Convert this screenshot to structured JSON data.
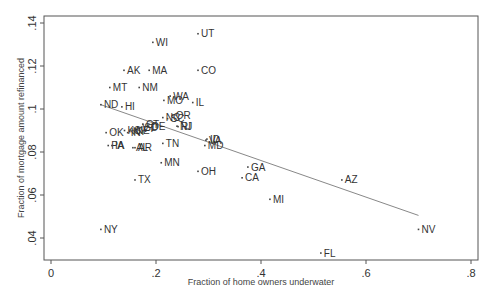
{
  "chart_data": {
    "type": "scatter",
    "title": "",
    "xlabel": "Fraction of home owners underwater",
    "ylabel": "Fraction of mortgage amount refinanced",
    "xlim": [
      -0.015,
      0.813
    ],
    "ylim": [
      0.029,
      0.143
    ],
    "xticks": [
      0,
      0.2,
      0.4,
      0.6,
      0.8
    ],
    "xtick_labels": [
      "0",
      ".2",
      ".4",
      ".6",
      ".8"
    ],
    "yticks": [
      0.04,
      0.06,
      0.08,
      0.1,
      0.12,
      0.14
    ],
    "ytick_labels": [
      ".04",
      ".06",
      ".08",
      ".1",
      ".12",
      ".14"
    ],
    "grid": false,
    "legend": "none",
    "fit_line": {
      "x": [
        0.095,
        0.7
      ],
      "y": [
        0.102,
        0.0505
      ]
    },
    "points": [
      {
        "label": "UT",
        "x": 0.28,
        "y": 0.135
      },
      {
        "label": "WI",
        "x": 0.194,
        "y": 0.131
      },
      {
        "label": "AK",
        "x": 0.139,
        "y": 0.118
      },
      {
        "label": "MA",
        "x": 0.187,
        "y": 0.118
      },
      {
        "label": "CO",
        "x": 0.28,
        "y": 0.118
      },
      {
        "label": "MT",
        "x": 0.112,
        "y": 0.11
      },
      {
        "label": "NM",
        "x": 0.168,
        "y": 0.11
      },
      {
        "label": "WA",
        "x": 0.227,
        "y": 0.106
      },
      {
        "label": "MO",
        "x": 0.215,
        "y": 0.104
      },
      {
        "label": "IL",
        "x": 0.27,
        "y": 0.103
      },
      {
        "label": "ND",
        "x": 0.095,
        "y": 0.102
      },
      {
        "label": "HI",
        "x": 0.135,
        "y": 0.101
      },
      {
        "label": "NC",
        "x": 0.213,
        "y": 0.096
      },
      {
        "label": "SC",
        "x": 0.222,
        "y": 0.0955
      },
      {
        "label": "OR",
        "x": 0.232,
        "y": 0.097
      },
      {
        "label": "NJ",
        "x": 0.24,
        "y": 0.092
      },
      {
        "label": "RI",
        "x": 0.242,
        "y": 0.0918
      },
      {
        "label": "CT",
        "x": 0.175,
        "y": 0.093
      },
      {
        "label": "DE",
        "x": 0.186,
        "y": 0.092
      },
      {
        "label": "VT",
        "x": 0.168,
        "y": 0.091
      },
      {
        "label": "SD",
        "x": 0.172,
        "y": 0.0915
      },
      {
        "label": "KS",
        "x": 0.14,
        "y": 0.09
      },
      {
        "label": "IN",
        "x": 0.146,
        "y": 0.089
      },
      {
        "label": "KY",
        "x": 0.15,
        "y": 0.0895
      },
      {
        "label": "NE",
        "x": 0.156,
        "y": 0.09
      },
      {
        "label": "OK",
        "x": 0.105,
        "y": 0.089
      },
      {
        "label": "PA",
        "x": 0.109,
        "y": 0.083
      },
      {
        "label": "IA",
        "x": 0.116,
        "y": 0.083
      },
      {
        "label": "AL",
        "x": 0.156,
        "y": 0.082
      },
      {
        "label": "AR",
        "x": 0.16,
        "y": 0.082
      },
      {
        "label": "TN",
        "x": 0.213,
        "y": 0.084
      },
      {
        "label": "MN",
        "x": 0.21,
        "y": 0.075
      },
      {
        "label": "TX",
        "x": 0.16,
        "y": 0.067
      },
      {
        "label": "NY",
        "x": 0.095,
        "y": 0.044
      },
      {
        "label": "ID",
        "x": 0.297,
        "y": 0.086
      },
      {
        "label": "VA",
        "x": 0.295,
        "y": 0.0855
      },
      {
        "label": "MD",
        "x": 0.293,
        "y": 0.083
      },
      {
        "label": "OH",
        "x": 0.28,
        "y": 0.071
      },
      {
        "label": "GA",
        "x": 0.375,
        "y": 0.073
      },
      {
        "label": "CA",
        "x": 0.364,
        "y": 0.068
      },
      {
        "label": "MI",
        "x": 0.417,
        "y": 0.058
      },
      {
        "label": "AZ",
        "x": 0.554,
        "y": 0.067
      },
      {
        "label": "FL",
        "x": 0.514,
        "y": 0.033
      },
      {
        "label": "NV",
        "x": 0.7,
        "y": 0.044
      }
    ]
  },
  "colors": {
    "frame": "#555555",
    "fit_line": "#888888",
    "marker": "#444444",
    "text": "#333333"
  }
}
